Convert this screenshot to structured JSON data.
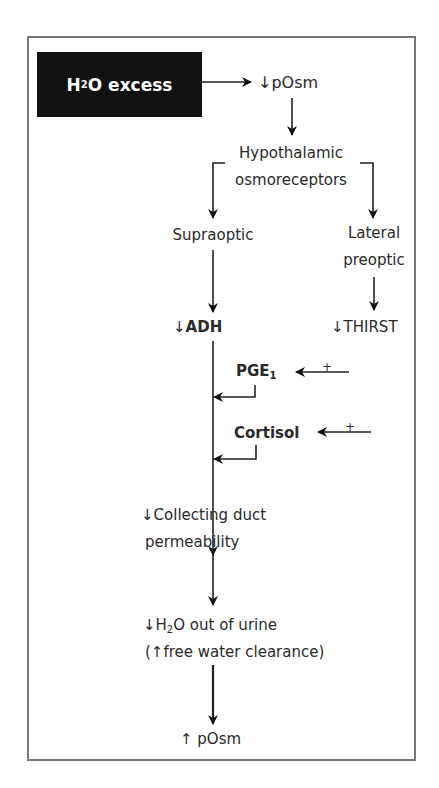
{
  "diagram": {
    "start_box": {
      "label_main": "H",
      "label_sub": "2",
      "label_rest": "O excess"
    },
    "nodes": {
      "posm_down": {
        "arrow": "↓",
        "text": "pOsm"
      },
      "hypothalamic": "Hypothalamic",
      "osmoreceptors": "osmoreceptors",
      "supraoptic": "Supraoptic",
      "lateral": "Lateral",
      "preoptic": "preoptic",
      "adh": {
        "arrow": "↓",
        "text": "ADH"
      },
      "thirst": {
        "arrow": "↓",
        "text": "THIRST"
      },
      "pge": {
        "text": "PGE",
        "sub": "1",
        "sign": "+"
      },
      "cortisol": {
        "text": "Cortisol",
        "sign": "+"
      },
      "collecting_line1": {
        "arrow": "↓",
        "text": "Collecting duct"
      },
      "collecting_line2": "permeability",
      "h2o_line1": {
        "arrow": "↓",
        "pre": "H",
        "sub": "2",
        "post": "O out of urine"
      },
      "h2o_line2": {
        "open": "(",
        "arrow": "↑",
        "text": "free water clearance)"
      },
      "posm_up": {
        "arrow": "↑",
        "text": " pOsm"
      }
    }
  }
}
